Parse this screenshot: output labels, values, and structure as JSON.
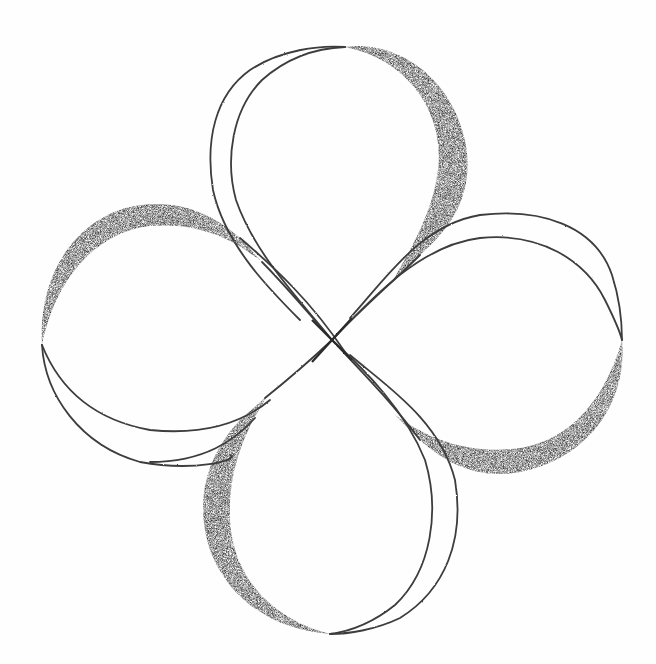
{
  "image": {
    "description": "Pencil drawing of a four-petal clover-like knot with shaded crescents on each petal",
    "medium": "graphite pencil on white paper",
    "width": 656,
    "height": 664
  },
  "colors": {
    "paper": "#fefefe",
    "line": "#3a3a3a",
    "shade_dark": "#2e2e2e",
    "shade_mid": "#5a5a5a"
  },
  "shape": {
    "center": [
      332,
      340
    ],
    "petals": [
      {
        "name": "top",
        "tip": [
          342,
          48
        ],
        "shaded_side": "right"
      },
      {
        "name": "right",
        "tip": [
          620,
          335
        ],
        "shaded_side": "bottom"
      },
      {
        "name": "bottom",
        "tip": [
          330,
          633
        ],
        "shaded_side": "left"
      },
      {
        "name": "left",
        "tip": [
          42,
          345
        ],
        "shaded_side": "top"
      }
    ]
  }
}
